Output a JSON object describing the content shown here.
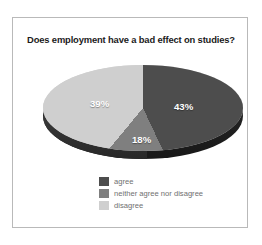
{
  "chart_data": {
    "type": "pie",
    "title": "Does employment have a bad effect on studies?",
    "categories": [
      "agree",
      "neither agree nor disagree",
      "disagree"
    ],
    "values": [
      43,
      18,
      39
    ],
    "value_labels": [
      "43%",
      "18%",
      "39%"
    ],
    "colors": [
      "#4d4d4d",
      "#7f7f7f",
      "#cfcfcf"
    ],
    "legend_position": "bottom",
    "grid": false,
    "xlabel": "",
    "ylabel": "",
    "three_d": true,
    "start_angle_deg": 0,
    "direction": "clockwise"
  },
  "figure": {
    "title": "Does employment have a bad effect on studies?",
    "border_color": "#b9b9b9",
    "background": "#ffffff"
  },
  "pie": {
    "slices": [
      {
        "name": "agree",
        "label": "43%",
        "value": 43,
        "color": "#4d4d4d"
      },
      {
        "name": "neither agree nor disagree",
        "label": "18%",
        "value": 18,
        "color": "#7f7f7f"
      },
      {
        "name": "disagree",
        "label": "39%",
        "value": 39,
        "color": "#cfcfcf"
      }
    ]
  },
  "legend": {
    "items": [
      {
        "label": "agree",
        "color": "#4d4d4d"
      },
      {
        "label": "neither agree nor disagree",
        "color": "#7f7f7f"
      },
      {
        "label": "disagree",
        "color": "#cfcfcf"
      }
    ]
  }
}
